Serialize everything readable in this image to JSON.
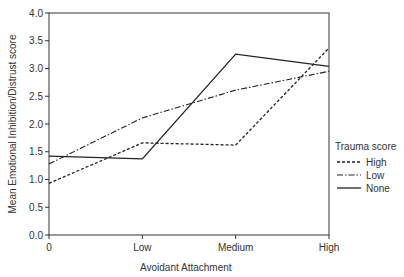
{
  "chart_data": {
    "type": "line",
    "title": "",
    "xlabel": "Avoidant Attachment",
    "ylabel": "Mean Emotional Inhibition/Distrust score",
    "categories": [
      "0",
      "Low",
      "Medium",
      "High"
    ],
    "ylim": [
      0.0,
      4.0
    ],
    "yticks": [
      "0.0",
      "0.5",
      "1.0",
      "1.5",
      "2.0",
      "2.5",
      "3.0",
      "3.5",
      "4.0"
    ],
    "grid": false,
    "legend_title": "Trauma score",
    "legend_position": "right",
    "series": [
      {
        "name": "High",
        "style": "dashed",
        "values": [
          0.93,
          1.66,
          1.62,
          3.37
        ]
      },
      {
        "name": "Low",
        "style": "dashdot",
        "values": [
          1.28,
          2.11,
          2.61,
          2.95
        ]
      },
      {
        "name": "None",
        "style": "solid",
        "values": [
          1.42,
          1.37,
          3.26,
          3.04
        ]
      }
    ]
  }
}
